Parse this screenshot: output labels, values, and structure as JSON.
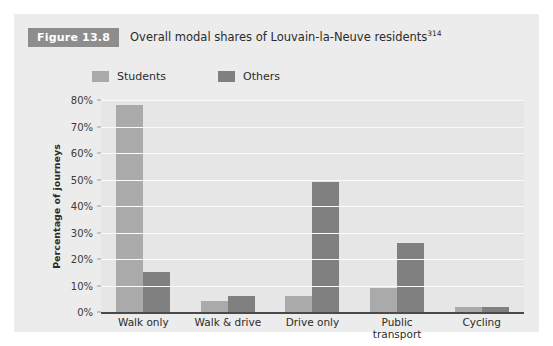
{
  "figure": {
    "badge": "Figure 13.8",
    "caption": "Overall modal shares of Louvain-la-Neuve residents",
    "caption_superscript": "314"
  },
  "colors": {
    "panel_background": "#ececec",
    "plot_background": "#e6e6e6",
    "gridline": "#fafafa",
    "axis_line": "#4a4a4a",
    "badge_background": "#8d8d8d",
    "students_bar": "#aaaaaa",
    "others_bar": "#808080",
    "text": "#2b2b2b"
  },
  "chart_data": {
    "type": "bar",
    "title": "Overall modal shares of Louvain-la-Neuve residents",
    "xlabel": "",
    "ylabel": "Percentage of journeys",
    "ylim": [
      0,
      80
    ],
    "ytick_labels": [
      "80%",
      "70%",
      "60%",
      "50%",
      "40%",
      "30%",
      "20%",
      "10%",
      "0%"
    ],
    "ytick_values": [
      80,
      70,
      60,
      50,
      40,
      30,
      20,
      10,
      0
    ],
    "grid": true,
    "legend_position": "top-left",
    "categories": [
      "Walk only",
      "Walk & drive",
      "Drive only",
      "Public transport",
      "Cycling"
    ],
    "category_lines": [
      [
        "Walk only"
      ],
      [
        "Walk & drive"
      ],
      [
        "Drive only"
      ],
      [
        "Public",
        "transport"
      ],
      [
        "Cycling"
      ]
    ],
    "series": [
      {
        "name": "Students",
        "color": "#aaaaaa",
        "values": [
          78,
          4,
          6,
          9,
          2
        ]
      },
      {
        "name": "Others",
        "color": "#808080",
        "values": [
          15,
          6,
          49,
          26,
          2
        ]
      }
    ]
  }
}
